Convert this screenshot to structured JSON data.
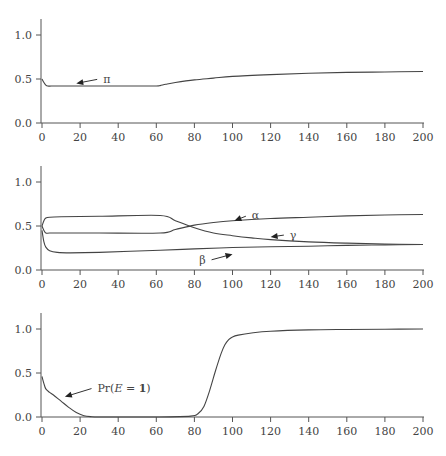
{
  "chart_data": [
    {
      "type": "line",
      "title": "",
      "xlabel": "",
      "ylabel": "",
      "xlim": [
        0,
        200
      ],
      "ylim": [
        0,
        1.2
      ],
      "xticks": [
        0,
        20,
        40,
        60,
        80,
        100,
        120,
        140,
        160,
        180,
        200
      ],
      "yticks": [
        0.0,
        0.5,
        1.0
      ],
      "xtick_labels": [
        "0",
        "20",
        "40",
        "60",
        "80",
        "100",
        "120",
        "140",
        "160",
        "180",
        "200"
      ],
      "ytick_labels": [
        "0.0",
        "0.5",
        "1.0"
      ],
      "grid": false,
      "series": [
        {
          "name": "π",
          "x": [
            0,
            1,
            2,
            3,
            5,
            10,
            20,
            30,
            40,
            50,
            60,
            62,
            65,
            70,
            80,
            90,
            100,
            120,
            140,
            160,
            180,
            200
          ],
          "values": [
            0.5,
            0.46,
            0.43,
            0.42,
            0.42,
            0.42,
            0.42,
            0.42,
            0.42,
            0.42,
            0.42,
            0.425,
            0.44,
            0.46,
            0.49,
            0.51,
            0.53,
            0.55,
            0.565,
            0.575,
            0.58,
            0.585
          ]
        }
      ],
      "annotations": [
        {
          "text": "π",
          "x": 30,
          "y": 0.5,
          "arrow_to": [
            18,
            0.45
          ]
        }
      ]
    },
    {
      "type": "line",
      "title": "",
      "xlabel": "",
      "ylabel": "",
      "xlim": [
        0,
        200
      ],
      "ylim": [
        0,
        1.2
      ],
      "xticks": [
        0,
        20,
        40,
        60,
        80,
        100,
        120,
        140,
        160,
        180,
        200
      ],
      "yticks": [
        0.0,
        0.5,
        1.0
      ],
      "xtick_labels": [
        "0",
        "20",
        "40",
        "60",
        "80",
        "100",
        "120",
        "140",
        "160",
        "180",
        "200"
      ],
      "ytick_labels": [
        "0.0",
        "0.5",
        "1.0"
      ],
      "grid": false,
      "series": [
        {
          "name": "α",
          "x": [
            0,
            1,
            2,
            4,
            10,
            30,
            62,
            70,
            80,
            90,
            100,
            120,
            140,
            160,
            180,
            200
          ],
          "values": [
            0.5,
            0.45,
            0.42,
            0.42,
            0.42,
            0.42,
            0.42,
            0.46,
            0.51,
            0.54,
            0.56,
            0.585,
            0.6,
            0.615,
            0.625,
            0.63
          ]
        },
        {
          "name": "β",
          "x": [
            0,
            1,
            2,
            4,
            8,
            15,
            30,
            62,
            80,
            100,
            120,
            140,
            160,
            180,
            200
          ],
          "values": [
            0.45,
            0.32,
            0.26,
            0.22,
            0.2,
            0.195,
            0.2,
            0.225,
            0.24,
            0.255,
            0.265,
            0.27,
            0.28,
            0.285,
            0.29
          ]
        },
        {
          "name": "γ",
          "x": [
            0,
            1,
            2,
            4,
            10,
            30,
            62,
            70,
            80,
            90,
            100,
            110,
            120,
            140,
            160,
            180,
            200
          ],
          "values": [
            0.5,
            0.56,
            0.59,
            0.6,
            0.605,
            0.61,
            0.62,
            0.56,
            0.48,
            0.42,
            0.39,
            0.365,
            0.345,
            0.32,
            0.305,
            0.295,
            0.29
          ]
        }
      ],
      "annotations": [
        {
          "text": "α",
          "x": 108,
          "y": 0.62,
          "arrow_to": [
            101,
            0.56
          ]
        },
        {
          "text": "γ",
          "x": 128,
          "y": 0.4,
          "arrow_to": [
            120,
            0.375
          ]
        },
        {
          "text": "β",
          "x": 88,
          "y": 0.11,
          "arrow_to": [
            100,
            0.18
          ]
        }
      ]
    },
    {
      "type": "line",
      "title": "",
      "xlabel": "",
      "ylabel": "",
      "xlim": [
        0,
        200
      ],
      "ylim": [
        0,
        1.2
      ],
      "xticks": [
        0,
        20,
        40,
        60,
        80,
        100,
        120,
        140,
        160,
        180,
        200
      ],
      "yticks": [
        0.0,
        0.5,
        1.0
      ],
      "xtick_labels": [
        "0",
        "20",
        "40",
        "60",
        "80",
        "100",
        "120",
        "140",
        "160",
        "180",
        "200"
      ],
      "ytick_labels": [
        "0.0",
        "0.5",
        "1.0"
      ],
      "grid": false,
      "series": [
        {
          "name": "Pr(E = 1)",
          "x": [
            0,
            1,
            2,
            4,
            6,
            10,
            14,
            18,
            22,
            26,
            30,
            40,
            60,
            78,
            82,
            85,
            88,
            91,
            94,
            96,
            98,
            100,
            103,
            110,
            120,
            140,
            160,
            180,
            200
          ],
          "values": [
            0.46,
            0.38,
            0.32,
            0.28,
            0.25,
            0.18,
            0.11,
            0.05,
            0.015,
            0.003,
            0.0,
            0.0,
            0.0,
            0.01,
            0.04,
            0.12,
            0.3,
            0.52,
            0.72,
            0.82,
            0.88,
            0.91,
            0.93,
            0.955,
            0.975,
            0.99,
            0.995,
            0.998,
            1.0
          ]
        }
      ],
      "annotations": [
        {
          "text": "Pr(E = 1)",
          "x": 27,
          "y": 0.33,
          "arrow_to": [
            12,
            0.23
          ]
        }
      ]
    }
  ],
  "panels": [
    {
      "labels": {
        "pi": "π"
      }
    },
    {
      "labels": {
        "alpha": "α",
        "beta": "β",
        "gamma": "γ"
      }
    },
    {
      "labels": {
        "pr_prefix": "Pr(",
        "pr_var": "E",
        "pr_eq": " = ",
        "pr_val": "1",
        "pr_suffix": ")"
      }
    }
  ]
}
